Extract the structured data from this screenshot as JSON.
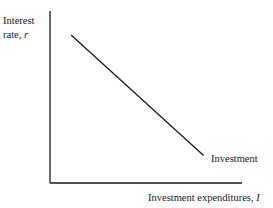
{
  "chart_data": {
    "type": "line",
    "title": "",
    "xlabel": "Investment expenditures, ",
    "xlabel_var": "I",
    "ylabel_line1": "Interest",
    "ylabel_line2": "rate, ",
    "ylabel_var": "r",
    "grid": false,
    "xlim": [
      0,
      10
    ],
    "ylim": [
      0,
      10
    ],
    "series": [
      {
        "name": "Investment",
        "x": [
          1.1,
          8.0
        ],
        "y": [
          8.6,
          1.6
        ]
      }
    ],
    "annotations": [
      {
        "text": "Investment",
        "anchor": "line-end"
      }
    ]
  },
  "colors": {
    "axis": "#1a1a1a",
    "line": "#1a1a1a",
    "background": "#ffffff"
  }
}
